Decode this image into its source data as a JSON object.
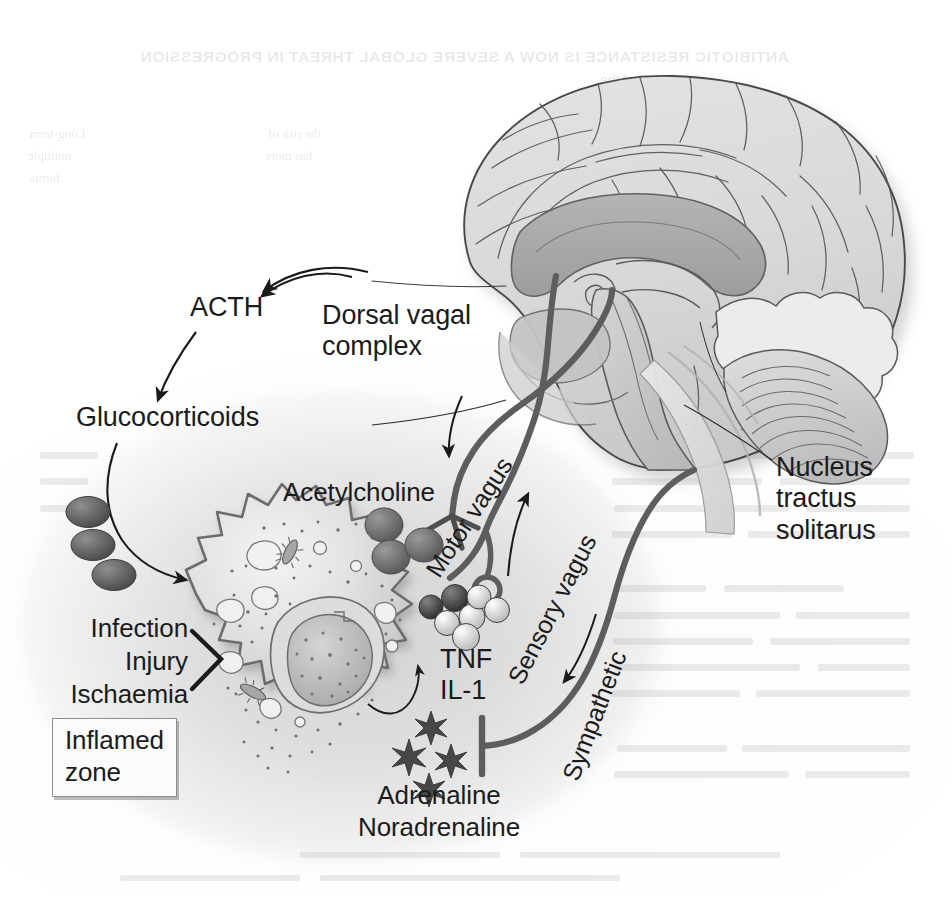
{
  "figure": {
    "type": "anatomical-pathway-diagram",
    "background_color": "#ffffff",
    "ink_color": "#1b1b1b",
    "nerve_color": "#5d5d5d"
  },
  "labels": {
    "acth": "ACTH",
    "glucocorticoids": "Glucocorticoids",
    "dorsal_vagal_complex": [
      "Dorsal vagal",
      "complex"
    ],
    "nucleus_tractus_solitarus": [
      "Nucleus",
      "tractus",
      "solitarus"
    ],
    "acetylcholine": "Acetylcholine",
    "motor_vagus": "Motor vagus",
    "sensory_vagus": "Sensory vagus",
    "sympathetic": "Sympathetic",
    "cytokines": [
      "TNF",
      "IL-1"
    ],
    "stimuli": [
      "Infection",
      "Injury",
      "Ischaemia"
    ],
    "inflamed_zone": [
      "Inflamed",
      "zone"
    ],
    "catecholamines": [
      "Adrenaline",
      "Noradrenaline"
    ]
  },
  "structures": {
    "brain": "mid-sagittal human brain with corpus callosum, brainstem and cerebellum",
    "macrophage": "activated macrophage with nucleus, vacuoles, granules and phagocytosed bacteria",
    "glucocorticoid_granules_count": 3,
    "acetylcholine_granules_count": 3,
    "cytokine_spheres_count": 7,
    "catecholamine_bursts_count": 4
  },
  "connections": [
    {
      "from": "brain",
      "to": "acth",
      "kind": "arrow"
    },
    {
      "from": "acth",
      "to": "glucocorticoids",
      "kind": "arrow"
    },
    {
      "from": "glucocorticoids",
      "to": "macrophage",
      "kind": "arrow"
    },
    {
      "from": "stimuli",
      "to": "macrophage",
      "kind": "bracket"
    },
    {
      "from": "dorsal-vagal-complex",
      "to": "acetylcholine",
      "kind": "motor-vagus-nerve"
    },
    {
      "from": "cytokines",
      "to": "brainstem",
      "kind": "sensory-vagus-nerve"
    },
    {
      "from": "brainstem",
      "to": "catecholamines",
      "kind": "sympathetic-nerve-inhibition"
    },
    {
      "from": "macrophage",
      "to": "cytokines",
      "kind": "arrow"
    },
    {
      "from": "macrophage",
      "to": "catecholamines",
      "kind": "arrow"
    }
  ],
  "ghost_text": {
    "line_top": "ANTIBIOTIC RESISTANCE IS NOW A SEVERE GLOBAL THREAT IN PROGRESSION",
    "line_top_sub": "of the",
    "col_left": [
      "Long-term",
      "multiple",
      "forms"
    ],
    "col_right": [
      "the risk of",
      "has more",
      "to",
      "the",
      "Sarah"
    ]
  }
}
